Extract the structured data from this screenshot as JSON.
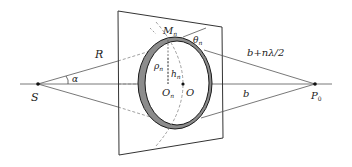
{
  "figure": {
    "type": "diagram",
    "labels": {
      "source": "S",
      "observer_main": "P",
      "observer_sub": "0",
      "R": "R",
      "alpha": "α",
      "M_main": "M",
      "M_sub": "n",
      "theta_main": "θ",
      "theta_sub": "n",
      "rho_main": "ρ",
      "rho_sub": "n",
      "h_main": "h",
      "h_sub": "n",
      "On_main": "O",
      "On_sub": "n",
      "O": "O",
      "b": "b",
      "path": "b+nλ/2"
    },
    "colors": {
      "line": "#444444",
      "ring_fill": "#8c8c8c",
      "ring_edge": "#1a1a1a",
      "dashed": "#888888",
      "background": "#ffffff"
    }
  }
}
